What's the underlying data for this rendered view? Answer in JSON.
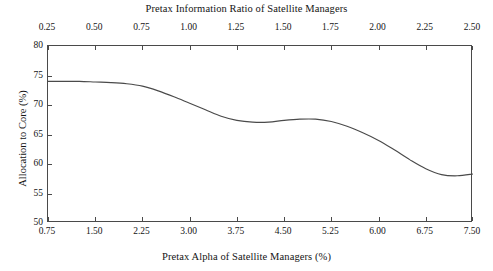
{
  "chart_data": {
    "type": "line",
    "title": "",
    "top_axis_title": "Pretax Information Ratio of Satellite Managers",
    "xlabel": "Pretax Alpha of Satellite Managers (%)",
    "ylabel": "Allocation to Core (%)",
    "grid": false,
    "legend": "none",
    "line_color": "#4a4a4a",
    "frame_color": "#4a4a4a",
    "background": "#ffffff",
    "xlim": [
      0.75,
      7.5
    ],
    "ylim": [
      50,
      80
    ],
    "top_xlim": [
      0.25,
      2.5
    ],
    "xticks": [
      "0.75",
      "1.50",
      "2.25",
      "3.00",
      "3.75",
      "4.50",
      "5.25",
      "6.00",
      "6.75",
      "7.50"
    ],
    "xtick_values": [
      0.75,
      1.5,
      2.25,
      3.0,
      3.75,
      4.5,
      5.25,
      6.0,
      6.75,
      7.5
    ],
    "top_xticks": [
      "0.25",
      "0.50",
      "0.75",
      "1.00",
      "1.25",
      "1.50",
      "1.75",
      "2.00",
      "2.25",
      "2.50"
    ],
    "top_xtick_values": [
      0.25,
      0.5,
      0.75,
      1.0,
      1.25,
      1.5,
      1.75,
      2.0,
      2.25,
      2.5
    ],
    "yticks": [
      "50",
      "55",
      "60",
      "65",
      "70",
      "75",
      "80"
    ],
    "ytick_values": [
      50,
      55,
      60,
      65,
      70,
      75,
      80
    ],
    "series": [
      {
        "name": "Allocation to Core",
        "x": [
          0.75,
          1.0,
          1.25,
          1.5,
          1.75,
          2.0,
          2.25,
          2.5,
          2.75,
          3.0,
          3.25,
          3.5,
          3.75,
          4.0,
          4.25,
          4.5,
          4.75,
          5.0,
          5.25,
          5.5,
          5.75,
          6.0,
          6.25,
          6.5,
          6.75,
          7.0,
          7.25,
          7.5
        ],
        "values": [
          74.0,
          74.0,
          74.0,
          73.9,
          73.8,
          73.6,
          73.2,
          72.4,
          71.4,
          70.3,
          69.2,
          68.1,
          67.4,
          67.1,
          67.1,
          67.4,
          67.6,
          67.6,
          67.2,
          66.4,
          65.3,
          64.0,
          62.4,
          60.7,
          59.2,
          58.2,
          58.0,
          58.3
        ]
      }
    ]
  }
}
